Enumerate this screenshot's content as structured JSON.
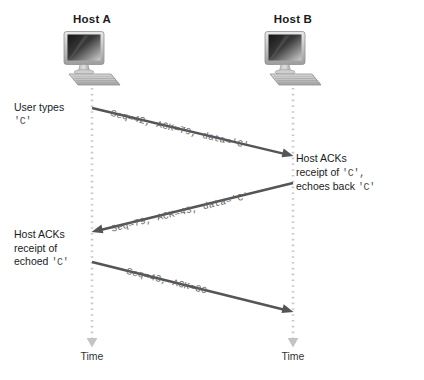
{
  "diagram": {
    "background_color": "#ffffff",
    "lifeline_color": "#c9c9c9",
    "arrow_color": "#555555",
    "text_color": "#1b1b1b",
    "mono_text_color": "#636363"
  },
  "hosts": [
    {
      "id": "host-a",
      "title": "Host A",
      "icon": "computer-icon",
      "time_label": "Time"
    },
    {
      "id": "host-b",
      "title": "Host B",
      "icon": "computer-icon",
      "time_label": "Time"
    }
  ],
  "annotations": [
    {
      "id": "user-types",
      "side": "left",
      "lines": [
        {
          "text": "User types",
          "style": "sans"
        },
        {
          "text": "'C'",
          "style": "mono"
        }
      ]
    },
    {
      "id": "host-b-ack",
      "side": "right",
      "lines": [
        {
          "text": "Host ACKs",
          "style": "sans"
        },
        {
          "text": "receipt of ",
          "style": "sans",
          "mono_suffix": "'C',"
        },
        {
          "text": "echoes back ",
          "style": "sans",
          "mono_suffix": "'C'"
        }
      ]
    },
    {
      "id": "host-a-ack",
      "side": "left",
      "lines": [
        {
          "text": "Host ACKs",
          "style": "sans"
        },
        {
          "text": "receipt of",
          "style": "sans"
        },
        {
          "text": "echoed ",
          "style": "sans",
          "mono_suffix": "'C'"
        }
      ]
    }
  ],
  "messages": [
    {
      "id": "msg-1",
      "label": "Seq=42, ACK=79, data='C'",
      "direction": "a-to-b",
      "from": {
        "x": 92,
        "y": 108
      },
      "to": {
        "x": 293,
        "y": 156
      }
    },
    {
      "id": "msg-2",
      "label": "Seq=79, ACK=43, data='C'",
      "direction": "b-to-a",
      "from": {
        "x": 293,
        "y": 183
      },
      "to": {
        "x": 92,
        "y": 232
      }
    },
    {
      "id": "msg-3",
      "label": "Seq=43, ACK=80",
      "direction": "a-to-b",
      "from": {
        "x": 92,
        "y": 262
      },
      "to": {
        "x": 293,
        "y": 312
      }
    }
  ],
  "annotation_text": {
    "user_types_line1": "User types",
    "user_types_line2": "'C'",
    "host_b_line1": "Host ACKs",
    "host_b_line2_sans": "receipt of ",
    "host_b_line2_mono": "'C',",
    "host_b_line3_sans": "echoes back ",
    "host_b_line3_mono": "'C'",
    "host_a_line1": "Host ACKs",
    "host_a_line2": "receipt of",
    "host_a_line3_sans": "echoed ",
    "host_a_line3_mono": "'C'"
  }
}
